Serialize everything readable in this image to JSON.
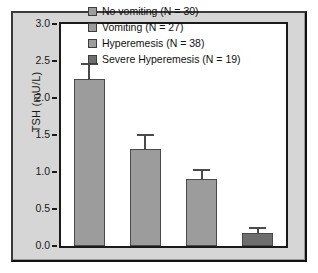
{
  "chart_data": {
    "type": "bar",
    "title": "",
    "xlabel": "",
    "ylabel": "TSH (mU/L)",
    "ylim": [
      0.0,
      3.0
    ],
    "yticks": [
      "0.0",
      "0.5",
      "1.0",
      "1.5",
      "2.0",
      "2.5",
      "3.0"
    ],
    "ytick_values": [
      0.0,
      0.5,
      1.0,
      1.5,
      2.0,
      2.5,
      3.0
    ],
    "grid": false,
    "legend_position": "top-right",
    "categories": [
      "No vomiting (N = 30)",
      "Vomiting (N = 27)",
      "Hyperemesis (N = 38)",
      "Severe Hyperemesis (N = 19)"
    ],
    "values": [
      2.26,
      1.31,
      0.9,
      0.17
    ],
    "errors": [
      0.21,
      0.21,
      0.14,
      0.09
    ],
    "error_upper": [
      2.47,
      1.52,
      1.04,
      0.26
    ],
    "bar_colors": [
      "#9c9c9c",
      "#9c9c9c",
      "#9c9c9c",
      "#6e6e6e"
    ],
    "bar_edge_color": "#4a4a4a",
    "errorbar_color": "#4a4a4a",
    "axis_color": "#1a1a1a",
    "plot_background": "#ffffff",
    "panel_background": "#d6d6d6"
  },
  "legend": {
    "items": [
      {
        "label": "No vomiting (N = 30)",
        "color": "#9c9c9c"
      },
      {
        "label": "Vomiting (N = 27)",
        "color": "#9c9c9c"
      },
      {
        "label": "Hyperemesis (N = 38)",
        "color": "#9c9c9c"
      },
      {
        "label": "Severe Hyperemesis (N = 19)",
        "color": "#6e6e6e"
      }
    ]
  },
  "axes": {
    "y_label": "TSH (mU/L)"
  }
}
